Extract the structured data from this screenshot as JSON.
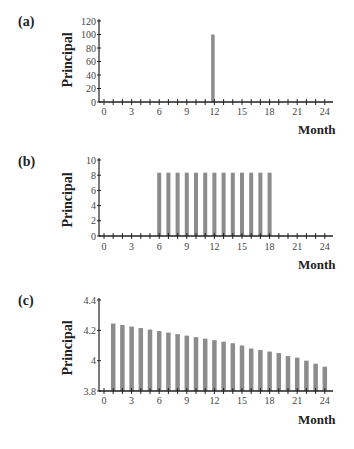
{
  "chart_data": [
    {
      "type": "bar",
      "panel": "(a)",
      "title": "",
      "xlabel": "Month",
      "ylabel": "Principal",
      "ylim": [
        0,
        120
      ],
      "yticks": [
        0,
        20,
        40,
        60,
        80,
        100,
        120
      ],
      "xlim": [
        0,
        24
      ],
      "xticks": [
        0,
        3,
        6,
        9,
        12,
        15,
        18,
        21,
        24
      ],
      "grid": false,
      "x": [
        12
      ],
      "values": [
        100
      ]
    },
    {
      "type": "bar",
      "panel": "(b)",
      "title": "",
      "xlabel": "Month",
      "ylabel": "Principal",
      "ylim": [
        0,
        10
      ],
      "yticks": [
        0,
        2,
        4,
        6,
        8,
        10
      ],
      "xlim": [
        0,
        24
      ],
      "xticks": [
        0,
        3,
        6,
        9,
        12,
        15,
        18,
        21,
        24
      ],
      "grid": false,
      "x": [
        6,
        7,
        8,
        9,
        10,
        11,
        12,
        13,
        14,
        15,
        16,
        17,
        18
      ],
      "values": [
        8.33,
        8.33,
        8.33,
        8.33,
        8.33,
        8.33,
        8.33,
        8.33,
        8.33,
        8.33,
        8.33,
        8.33,
        8.33
      ]
    },
    {
      "type": "bar",
      "panel": "(c)",
      "title": "",
      "xlabel": "Month",
      "ylabel": "Principal",
      "ylim": [
        3.8,
        4.4
      ],
      "yticks": [
        3.8,
        4,
        4.2,
        4.4
      ],
      "ytick_labels": [
        "3.8",
        "4",
        "4.2",
        "4.4"
      ],
      "xlim": [
        0,
        24
      ],
      "xticks": [
        0,
        3,
        6,
        9,
        12,
        15,
        18,
        21,
        24
      ],
      "grid": false,
      "x": [
        1,
        2,
        3,
        4,
        5,
        6,
        7,
        8,
        9,
        10,
        11,
        12,
        13,
        14,
        15,
        16,
        17,
        18,
        19,
        20,
        21,
        22,
        23,
        24
      ],
      "values": [
        4.245,
        4.235,
        4.225,
        4.215,
        4.205,
        4.195,
        4.185,
        4.175,
        4.165,
        4.155,
        4.145,
        4.135,
        4.125,
        4.115,
        4.1,
        4.08,
        4.07,
        4.06,
        4.05,
        4.03,
        4.02,
        4.0,
        3.98,
        3.96
      ]
    }
  ],
  "panels": {
    "a": {
      "label": "(a)",
      "ylabel": "Principal",
      "xlabel": "Month"
    },
    "b": {
      "label": "(b)",
      "ylabel": "Principal",
      "xlabel": "Month"
    },
    "c": {
      "label": "(c)",
      "ylabel": "Principal",
      "xlabel": "Month"
    }
  },
  "colors": {
    "bar": "#8c8c8c",
    "axis": "#222222"
  }
}
